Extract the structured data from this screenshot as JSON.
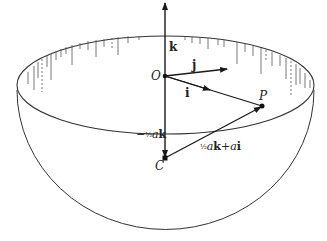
{
  "diagram": {
    "colors": {
      "stroke": "#1a1a1a",
      "background": "#ffffff"
    },
    "points": {
      "O": {
        "label": "O",
        "x": 165,
        "y": 76
      },
      "C": {
        "label": "C",
        "x": 165,
        "y": 158
      },
      "P": {
        "label": "P",
        "x": 262,
        "y": 106
      }
    },
    "vectors": {
      "k": {
        "label": "k"
      },
      "j": {
        "label": "j"
      },
      "i": {
        "label": "i"
      },
      "OC": {
        "prefix": "−",
        "frac": "½",
        "coef": "a",
        "unit": "k"
      },
      "CP": {
        "frac": "½",
        "coef": "a",
        "unit": "k",
        "plus": "+",
        "coef2": "a",
        "unit2": "i"
      }
    }
  }
}
